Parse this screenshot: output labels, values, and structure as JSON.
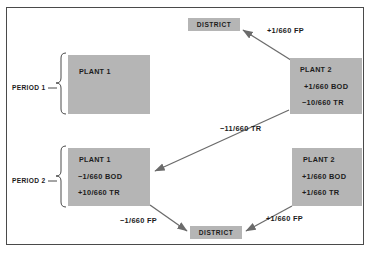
{
  "figure": {
    "border_color": "#4a4a4a",
    "node_fill": "#b5b5b5",
    "edge_color": "#6b6b6b",
    "text_color": "#1c1c1c"
  },
  "periods": [
    {
      "label": "PERIOD 1"
    },
    {
      "label": "PERIOD 2"
    }
  ],
  "nodes": {
    "district_top": {
      "label": "DISTRICT"
    },
    "district_bottom": {
      "label": "DISTRICT"
    },
    "plant1_p1": {
      "title": "PLANT 1",
      "lines": []
    },
    "plant2_p1": {
      "title": "PLANT 2",
      "lines": [
        "+1/660 BOD",
        "−10/660 TR"
      ]
    },
    "plant1_p2": {
      "title": "PLANT 1",
      "lines": [
        "−1/660 BOD",
        "+10/660 TR"
      ]
    },
    "plant2_p2": {
      "title": "PLANT 2",
      "lines": [
        "+1/660 BOD",
        "+1/660 TR"
      ]
    }
  },
  "edge_labels": {
    "p1_plant2_to_district": "+1/660 FP",
    "p1_plant2_to_p2_plant1": "−11/660 TR",
    "p2_plant1_to_district": "−1/660 FP",
    "p2_plant2_to_district": "+1/660 FP"
  }
}
